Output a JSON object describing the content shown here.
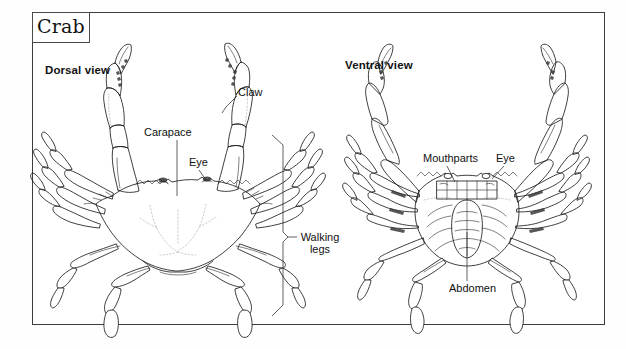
{
  "figure": {
    "title": "Crab",
    "views": [
      {
        "id": "dorsal",
        "heading": "Dorsal view"
      },
      {
        "id": "ventral",
        "heading": "Ventral view"
      }
    ]
  },
  "labels": {
    "claw": "Claw",
    "carapace": "Carapace",
    "eye_dorsal": "Eye",
    "walking_legs": "Walking legs",
    "mouthparts": "Mouthparts",
    "eye_ventral": "Eye",
    "abdomen": "Abdomen"
  },
  "colors": {
    "ink": "#1d1d1d",
    "frame": "#3c3c3c",
    "paper": "#ffffff",
    "page": "#fefefe",
    "faint": "#9a9a9a"
  }
}
